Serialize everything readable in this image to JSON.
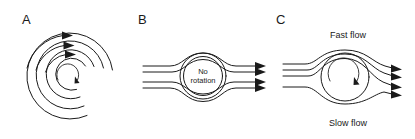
{
  "figure": {
    "background_color": "#ffffff",
    "line_color": "#1a1a1a",
    "width": 415,
    "height": 139
  },
  "panels": [
    {
      "letter": "A",
      "letter_x": 22,
      "letter_y": 24,
      "description": "concentric circular arcs with three arrowheads at upper right and a small clockwise rotation arrow at the center",
      "arc_count": 4,
      "arrow_count": 3,
      "center_rotation": "clockwise"
    },
    {
      "letter": "B",
      "letter_x": 138,
      "letter_y": 24,
      "description": "symmetric streamlines passing around a non-rotating circle",
      "circle_label_line1": "No",
      "circle_label_line2": "rotation",
      "streamline_count": 4,
      "arrow_count": 4,
      "center_rotation": "none"
    },
    {
      "letter": "C",
      "letter_x": 276,
      "letter_y": 24,
      "description": "asymmetric streamlines around a rotating circle, compressed above and spread below",
      "top_label": "Fast flow",
      "bottom_label": "Slow flow",
      "top_label_x": 348,
      "top_label_y": 38,
      "bottom_label_x": 348,
      "bottom_label_y": 126,
      "streamline_count": 4,
      "arrow_count": 4,
      "center_rotation": "clockwise"
    }
  ]
}
